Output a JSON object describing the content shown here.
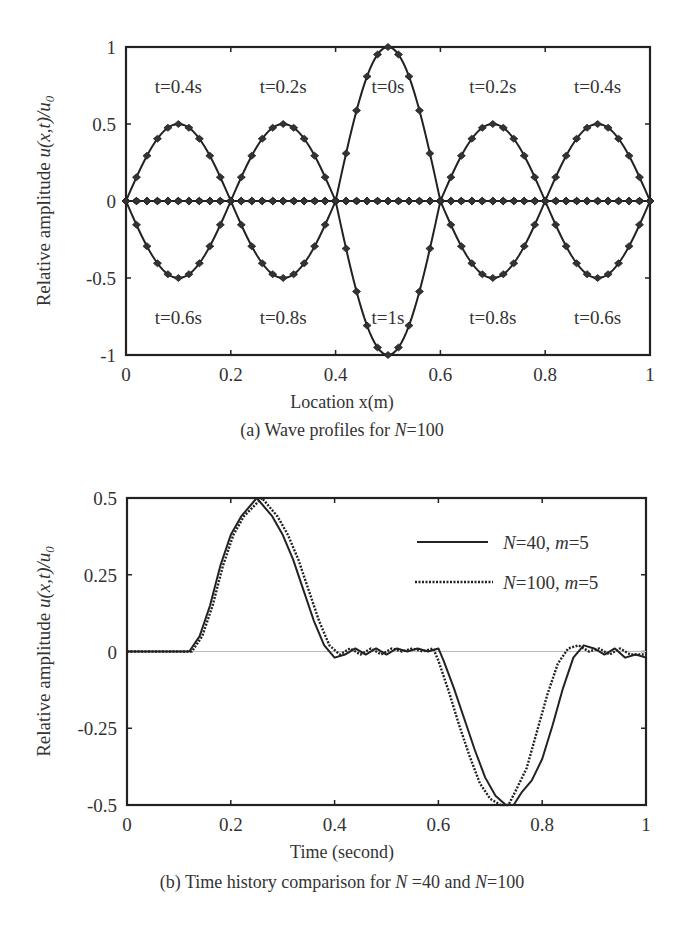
{
  "figures": {
    "a": {
      "caption_prefix": "(a) Wave profiles for ",
      "caption_var": "N",
      "caption_suffix": "=100",
      "xlabel": "Location x(m)",
      "ylabel_text": "Relative amplitude ",
      "ylabel_math": "u(x,t)/u",
      "ylabel_sub": "0"
    },
    "b": {
      "caption_prefix": "(b) Time history comparison for ",
      "caption_var1": "N",
      "caption_mid": " =40 and ",
      "caption_var2": "N",
      "caption_suffix": "=100",
      "xlabel": "Time (second)",
      "ylabel_text": "Relative amplitude ",
      "ylabel_math": "u(x,t)/u",
      "ylabel_sub": "0",
      "legend": [
        {
          "var": "N",
          "label": "=40, ",
          "var2": "m",
          "label2": "=5",
          "style": "solid"
        },
        {
          "var": "N",
          "label": "=100, ",
          "var2": "m",
          "label2": "=5",
          "style": "dotted"
        }
      ]
    }
  },
  "chart_data": [
    {
      "type": "line",
      "title": "(a) Wave profiles for N=100",
      "xlabel": "Location x(m)",
      "ylabel": "Relative amplitude u(x,t)/u0",
      "xlim": [
        0,
        1
      ],
      "ylim": [
        -1,
        1
      ],
      "xticks": [
        "0",
        "0.2",
        "0.4",
        "0.6",
        "0.8",
        "1"
      ],
      "yticks": [
        "-1",
        "-0.5",
        "0",
        "0.5",
        "1"
      ],
      "grid": false,
      "markers": "diamond",
      "annotations": [
        {
          "text": "t=0.4s",
          "x": 0.1,
          "y": 0.75
        },
        {
          "text": "t=0.2s",
          "x": 0.3,
          "y": 0.75
        },
        {
          "text": "t=0s",
          "x": 0.5,
          "y": 0.75
        },
        {
          "text": "t=0.2s",
          "x": 0.7,
          "y": 0.75
        },
        {
          "text": "t=0.4s",
          "x": 0.9,
          "y": 0.75
        },
        {
          "text": "t=0.6s",
          "x": 0.1,
          "y": -0.75
        },
        {
          "text": "t=0.8s",
          "x": 0.3,
          "y": -0.75
        },
        {
          "text": "t=1s",
          "x": 0.5,
          "y": -0.75
        },
        {
          "text": "t=0.8s",
          "x": 0.7,
          "y": -0.75
        },
        {
          "text": "t=0.6s",
          "x": 0.9,
          "y": -0.75
        }
      ],
      "series": [
        {
          "name": "t=0s",
          "shape": "half-sine pulse",
          "center": 0.5,
          "half_width": 0.1,
          "amplitude": 1.0
        },
        {
          "name": "t=0.2s",
          "shape": "half-sine pulse",
          "centers": [
            0.3,
            0.7
          ],
          "half_width": 0.1,
          "amplitude": 0.5
        },
        {
          "name": "t=0.4s",
          "shape": "half-sine pulse",
          "centers": [
            0.1,
            0.9
          ],
          "half_width": 0.1,
          "amplitude": 0.5
        },
        {
          "name": "t=0.6s",
          "shape": "half-sine pulse",
          "centers": [
            0.1,
            0.9
          ],
          "half_width": 0.1,
          "amplitude": -0.5
        },
        {
          "name": "t=0.8s",
          "shape": "half-sine pulse",
          "centers": [
            0.3,
            0.7
          ],
          "half_width": 0.1,
          "amplitude": -0.5
        },
        {
          "name": "t=1s",
          "shape": "half-sine pulse",
          "center": 0.5,
          "half_width": 0.1,
          "amplitude": -1.0
        }
      ]
    },
    {
      "type": "line",
      "title": "(b) Time history comparison for N =40 and N=100",
      "xlabel": "Time (second)",
      "ylabel": "Relative amplitude u(x,t)/u0",
      "xlim": [
        0,
        1
      ],
      "ylim": [
        -0.5,
        0.5
      ],
      "xticks": [
        "0",
        "0.2",
        "0.4",
        "0.6",
        "0.8",
        "1"
      ],
      "yticks": [
        "-0.5",
        "-0.25",
        "0",
        "0.25",
        "0.5"
      ],
      "grid": false,
      "legend_position": "upper right",
      "series": [
        {
          "name": "N=40, m=5",
          "style": "solid",
          "x": [
            0,
            0.12,
            0.14,
            0.16,
            0.18,
            0.2,
            0.22,
            0.25,
            0.28,
            0.3,
            0.32,
            0.34,
            0.36,
            0.38,
            0.4,
            0.42,
            0.44,
            0.46,
            0.48,
            0.5,
            0.52,
            0.54,
            0.56,
            0.58,
            0.6,
            0.61,
            0.63,
            0.65,
            0.67,
            0.69,
            0.71,
            0.73,
            0.745,
            0.76,
            0.78,
            0.8,
            0.82,
            0.84,
            0.86,
            0.88,
            0.9,
            0.92,
            0.94,
            0.96,
            0.98,
            1.0
          ],
          "y": [
            0,
            0,
            0.05,
            0.15,
            0.28,
            0.38,
            0.44,
            0.5,
            0.44,
            0.38,
            0.3,
            0.2,
            0.1,
            0.02,
            -0.02,
            -0.01,
            0.01,
            -0.01,
            0.01,
            -0.01,
            0.01,
            0,
            0.01,
            0,
            0.01,
            -0.03,
            -0.12,
            -0.22,
            -0.32,
            -0.41,
            -0.47,
            -0.5,
            -0.5,
            -0.46,
            -0.42,
            -0.35,
            -0.24,
            -0.12,
            -0.02,
            0.02,
            0.01,
            -0.01,
            0.01,
            -0.02,
            -0.01,
            -0.02
          ]
        },
        {
          "name": "N=100, m=5",
          "style": "dotted",
          "x": [
            0,
            0.125,
            0.145,
            0.165,
            0.185,
            0.205,
            0.225,
            0.26,
            0.29,
            0.31,
            0.33,
            0.35,
            0.37,
            0.39,
            0.41,
            0.43,
            0.45,
            0.47,
            0.49,
            0.51,
            0.53,
            0.55,
            0.57,
            0.59,
            0.6,
            0.62,
            0.64,
            0.66,
            0.68,
            0.7,
            0.72,
            0.735,
            0.75,
            0.77,
            0.79,
            0.81,
            0.83,
            0.85,
            0.87,
            0.89,
            0.91,
            0.93,
            0.95,
            0.97,
            0.99,
            1.0
          ],
          "y": [
            0,
            0,
            0.05,
            0.15,
            0.28,
            0.38,
            0.44,
            0.5,
            0.44,
            0.38,
            0.3,
            0.2,
            0.1,
            0.02,
            -0.01,
            0.01,
            -0.01,
            0.01,
            -0.01,
            0.01,
            0,
            0.01,
            0,
            0.01,
            -0.03,
            -0.13,
            -0.24,
            -0.34,
            -0.43,
            -0.48,
            -0.5,
            -0.5,
            -0.45,
            -0.38,
            -0.26,
            -0.14,
            -0.04,
            0.01,
            0.02,
            0.0,
            0.01,
            -0.01,
            0.01,
            -0.01,
            -0.01,
            -0.01
          ]
        }
      ]
    }
  ]
}
